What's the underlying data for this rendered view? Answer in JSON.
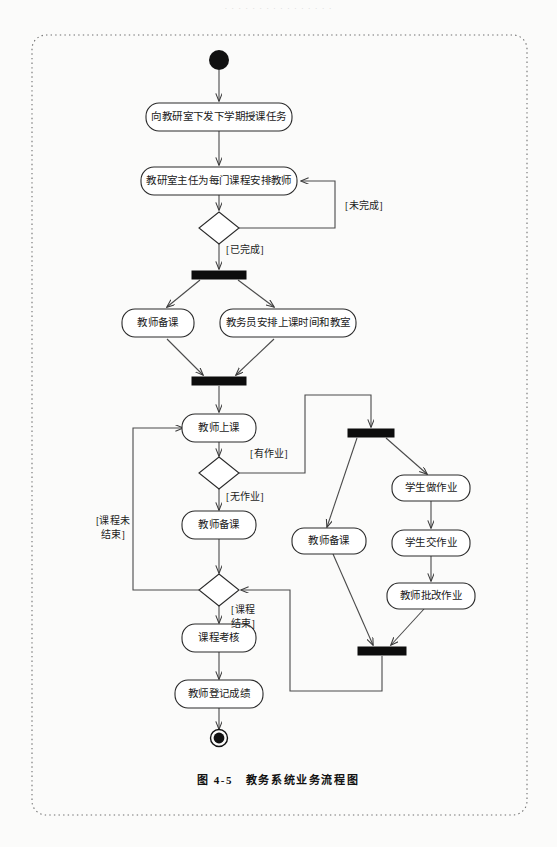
{
  "page": {
    "header_faint_text": "· · · · · · · · · · · · · · · ·",
    "caption": "图 4-5　教务系统业务流程图"
  },
  "diagram": {
    "type": "uml-activity-diagram",
    "title": "教务系统业务流程图",
    "colors": {
      "node_fill": "#ffffff",
      "node_stroke": "#2a2a2a",
      "bar_fill": "#0d0d0d",
      "flow_stroke": "#4a4a4a",
      "frame_stroke": "#6f6f6f",
      "text": "#1a1a1a"
    },
    "nodes": [
      {
        "id": "start",
        "kind": "initial-node",
        "label": "",
        "cx": 219,
        "cy": 60
      },
      {
        "id": "a1",
        "kind": "activity",
        "label": "向教研室下发下学期授课任务",
        "cx": 219,
        "cy": 117,
        "w": 146,
        "h": 28
      },
      {
        "id": "a2",
        "kind": "activity",
        "label": "教研室主任为每门课程安排教师",
        "cx": 219,
        "cy": 181,
        "w": 156,
        "h": 28
      },
      {
        "id": "d1",
        "kind": "decision",
        "label": "",
        "cx": 219,
        "cy": 228,
        "w": 40,
        "h": 32
      },
      {
        "id": "fork1",
        "kind": "fork-bar",
        "label": "",
        "cx": 219,
        "cy": 275,
        "w": 54,
        "h": 8
      },
      {
        "id": "a3",
        "kind": "activity",
        "label": "教师备课",
        "cx": 158,
        "cy": 323,
        "w": 72,
        "h": 28
      },
      {
        "id": "a4",
        "kind": "activity",
        "label": "教务员安排上课时间和教室",
        "cx": 288,
        "cy": 323,
        "w": 136,
        "h": 28
      },
      {
        "id": "join1",
        "kind": "join-bar",
        "label": "",
        "cx": 219,
        "cy": 381,
        "w": 54,
        "h": 8
      },
      {
        "id": "a5",
        "kind": "activity",
        "label": "教师上课",
        "cx": 219,
        "cy": 428,
        "w": 74,
        "h": 28
      },
      {
        "id": "d2",
        "kind": "decision",
        "label": "",
        "cx": 219,
        "cy": 473,
        "w": 40,
        "h": 32
      },
      {
        "id": "a6",
        "kind": "activity",
        "label": "教师备课",
        "cx": 219,
        "cy": 525,
        "w": 74,
        "h": 28
      },
      {
        "id": "d3",
        "kind": "decision",
        "label": "",
        "cx": 219,
        "cy": 590,
        "w": 40,
        "h": 32
      },
      {
        "id": "a7",
        "kind": "activity",
        "label": "课程考核",
        "cx": 219,
        "cy": 638,
        "w": 74,
        "h": 28
      },
      {
        "id": "a8",
        "kind": "activity",
        "label": "教师登记成绩",
        "cx": 219,
        "cy": 694,
        "w": 88,
        "h": 28
      },
      {
        "id": "end",
        "kind": "final-node",
        "label": "",
        "cx": 219,
        "cy": 738
      },
      {
        "id": "fork2",
        "kind": "fork-bar",
        "label": "",
        "cx": 371,
        "cy": 433,
        "w": 46,
        "h": 8
      },
      {
        "id": "b1",
        "kind": "activity",
        "label": "学生做作业",
        "cx": 431,
        "cy": 488,
        "w": 78,
        "h": 26
      },
      {
        "id": "b2",
        "kind": "activity",
        "label": "学生交作业",
        "cx": 431,
        "cy": 543,
        "w": 78,
        "h": 26
      },
      {
        "id": "b3",
        "kind": "activity",
        "label": "教师批改作业",
        "cx": 431,
        "cy": 596,
        "w": 88,
        "h": 26
      },
      {
        "id": "b4",
        "kind": "activity",
        "label": "教师备课",
        "cx": 329,
        "cy": 541,
        "w": 74,
        "h": 26
      },
      {
        "id": "join2",
        "kind": "join-bar",
        "label": "",
        "cx": 382,
        "cy": 651,
        "w": 48,
        "h": 8
      }
    ],
    "guards": [
      {
        "id": "g1",
        "text": "[未完成]",
        "x": 345,
        "y": 209
      },
      {
        "id": "g2",
        "text": "[已完成]",
        "x": 226,
        "y": 253
      },
      {
        "id": "g3",
        "text": "[有作业]",
        "x": 250,
        "y": 457
      },
      {
        "id": "g4",
        "text": "[无作业]",
        "x": 226,
        "y": 500
      },
      {
        "id": "g5a",
        "text": "[课程未",
        "x": 113,
        "y": 524
      },
      {
        "id": "g5b",
        "text": "结束]",
        "x": 113,
        "y": 538
      },
      {
        "id": "g6a",
        "text": "[课程",
        "x": 243,
        "y": 613
      },
      {
        "id": "g6b",
        "text": "结束]",
        "x": 243,
        "y": 627
      }
    ],
    "edges": [
      {
        "from": "start",
        "to": "a1",
        "label": ""
      },
      {
        "from": "a1",
        "to": "a2",
        "label": ""
      },
      {
        "from": "a2",
        "to": "d1",
        "label": ""
      },
      {
        "from": "d1",
        "to": "a2",
        "label": "[未完成]"
      },
      {
        "from": "d1",
        "to": "fork1",
        "label": "[已完成]"
      },
      {
        "from": "fork1",
        "to": "a3",
        "label": ""
      },
      {
        "from": "fork1",
        "to": "a4",
        "label": ""
      },
      {
        "from": "a3",
        "to": "join1",
        "label": ""
      },
      {
        "from": "a4",
        "to": "join1",
        "label": ""
      },
      {
        "from": "join1",
        "to": "a5",
        "label": ""
      },
      {
        "from": "a5",
        "to": "d2",
        "label": ""
      },
      {
        "from": "d2",
        "to": "fork2",
        "label": "[有作业]"
      },
      {
        "from": "d2",
        "to": "a6",
        "label": "[无作业]"
      },
      {
        "from": "a6",
        "to": "d3",
        "label": ""
      },
      {
        "from": "d3",
        "to": "a5",
        "label": "[课程未结束]"
      },
      {
        "from": "d3",
        "to": "a7",
        "label": "[课程结束]"
      },
      {
        "from": "a7",
        "to": "a8",
        "label": ""
      },
      {
        "from": "a8",
        "to": "end",
        "label": ""
      },
      {
        "from": "fork2",
        "to": "b1",
        "label": ""
      },
      {
        "from": "fork2",
        "to": "b4",
        "label": ""
      },
      {
        "from": "b1",
        "to": "b2",
        "label": ""
      },
      {
        "from": "b2",
        "to": "b3",
        "label": ""
      },
      {
        "from": "b3",
        "to": "join2",
        "label": ""
      },
      {
        "from": "b4",
        "to": "join2",
        "label": ""
      },
      {
        "from": "join2",
        "to": "d3",
        "label": ""
      }
    ]
  }
}
